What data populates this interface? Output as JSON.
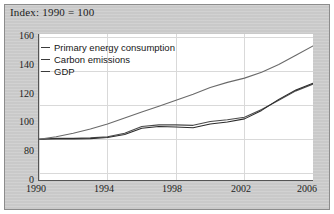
{
  "caption": "Index: 1990 = 100",
  "colors": {
    "panel_background": "#c9c9c9",
    "plot_background": "#ffffff",
    "axis": "#555555",
    "gridline": "#d9d9d9",
    "series_line": "#3b3b3b",
    "text": "#1c1c1c"
  },
  "legend": {
    "position": "top-left-inside",
    "items": [
      {
        "label": "Primary energy consumption",
        "color": "#4a4a4a"
      },
      {
        "label": "Carbon emissions",
        "color": "#2b2b2b"
      },
      {
        "label": "GDP",
        "color": "#6a6a6a"
      }
    ]
  },
  "axes": {
    "y_ticks": [
      "160",
      "140",
      "120",
      "100",
      "80",
      "0"
    ],
    "x_ticks": [
      "1990",
      "1994",
      "1998",
      "2002",
      "2006"
    ]
  },
  "chart_data": {
    "type": "line",
    "title": "Index: 1990 = 100",
    "xlabel": "",
    "ylabel": "Index: 1990 = 100",
    "xlim": [
      1990,
      2006
    ],
    "ylim": [
      76,
      162
    ],
    "y_axis_break": true,
    "y_break_label": "0",
    "grid": true,
    "grid_axis": "both",
    "legend_position": "upper left",
    "x": [
      1990,
      1991,
      1992,
      1993,
      1994,
      1995,
      1996,
      1997,
      1998,
      1999,
      2000,
      2001,
      2002,
      2003,
      2004,
      2005,
      2006
    ],
    "yticks": [
      80,
      100,
      120,
      140,
      160
    ],
    "xticks": [
      1990,
      1994,
      1998,
      2002,
      2006
    ],
    "series": [
      {
        "name": "Primary energy consumption",
        "values": [
          100,
          100.5,
          100.5,
          100.8,
          101.5,
          103.5,
          107.5,
          108.5,
          108.5,
          108.2,
          110.5,
          111.5,
          113.0,
          117.5,
          123.0,
          128.5,
          132.5
        ]
      },
      {
        "name": "Carbon emissions",
        "values": [
          100,
          100.3,
          100.2,
          100.4,
          101.0,
          102.8,
          106.5,
          107.5,
          107.2,
          106.8,
          109.0,
          110.2,
          112.0,
          117.0,
          123.5,
          129.0,
          133.0
        ]
      },
      {
        "name": "GDP",
        "values": [
          100,
          101.5,
          103.5,
          106.0,
          109.0,
          112.5,
          116.0,
          119.5,
          123.0,
          126.5,
          130.5,
          133.5,
          136.0,
          139.5,
          144.0,
          149.5,
          155.0
        ]
      }
    ]
  }
}
